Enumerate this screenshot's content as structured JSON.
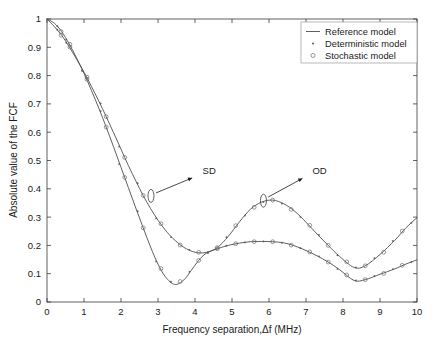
{
  "figure": {
    "title": "",
    "background_color": "#ffffff"
  },
  "axes": {
    "x_label": "Frequency separation,Δf (MHz)",
    "y_label": "Absolute value of the FCF",
    "x_ticks": [
      "0",
      "1",
      "2",
      "3",
      "4",
      "5",
      "6",
      "7",
      "8",
      "9",
      "10"
    ],
    "y_ticks": [
      "0",
      "0.1",
      "0.2",
      "0.3",
      "0.4",
      "0.5",
      "0.6",
      "0.7",
      "0.8",
      "0.9",
      "1"
    ]
  },
  "legend": {
    "position": "top-right",
    "entries": [
      {
        "label": "Reference model",
        "marker": "line"
      },
      {
        "label": "Deterministic model",
        "marker": "dot"
      },
      {
        "label": "Stochastic model",
        "marker": "circle"
      }
    ]
  },
  "annotations": [
    {
      "name": "sd-annotation",
      "label": "SD",
      "label_x": 4.15,
      "label_y": 0.445,
      "target_x": 2.81,
      "target_y": 0.375
    },
    {
      "name": "od-annotation",
      "label": "OD",
      "label_x": 7.12,
      "label_y": 0.445,
      "target_x": 5.85,
      "target_y": 0.358
    }
  ],
  "chart_data": {
    "type": "line",
    "title": "",
    "xlabel": "Frequency separation,Δf (MHz)",
    "ylabel": "Absolute value of the FCF",
    "xlim": [
      0,
      10
    ],
    "ylim": [
      0,
      1
    ],
    "xticks": [
      0,
      1,
      2,
      3,
      4,
      5,
      6,
      7,
      8,
      9,
      10
    ],
    "yticks": [
      0,
      0.1,
      0.2,
      0.3,
      0.4,
      0.5,
      0.6,
      0.7,
      0.8,
      0.9,
      1.0
    ],
    "grid": false,
    "legend_position": "upper right",
    "series": [
      {
        "name": "Reference model (SD)",
        "style": "line",
        "x": [
          0.0,
          0.2,
          0.4,
          0.6,
          0.8,
          1.0,
          1.2,
          1.4,
          1.6,
          1.8,
          2.0,
          2.2,
          2.4,
          2.6,
          2.8,
          3.0,
          3.2,
          3.45,
          3.7,
          3.9,
          4.1,
          4.3,
          4.6,
          4.9,
          5.2,
          5.5,
          5.8,
          6.1,
          6.4,
          6.7,
          7.0,
          7.3,
          7.6,
          7.9,
          8.3,
          8.6,
          9.0,
          9.4,
          9.7,
          10.0
        ],
        "y": [
          1.0,
          0.985,
          0.955,
          0.912,
          0.862,
          0.808,
          0.748,
          0.685,
          0.618,
          0.548,
          0.476,
          0.404,
          0.332,
          0.262,
          0.194,
          0.134,
          0.089,
          0.062,
          0.078,
          0.112,
          0.147,
          0.172,
          0.188,
          0.2,
          0.208,
          0.213,
          0.214,
          0.213,
          0.209,
          0.198,
          0.182,
          0.163,
          0.141,
          0.115,
          0.076,
          0.079,
          0.098,
          0.117,
          0.134,
          0.149
        ]
      },
      {
        "name": "Reference model (OD)",
        "style": "line",
        "x": [
          0.0,
          0.2,
          0.4,
          0.6,
          0.8,
          1.0,
          1.2,
          1.4,
          1.6,
          1.8,
          2.0,
          2.2,
          2.4,
          2.6,
          2.8,
          3.0,
          3.2,
          3.4,
          3.7,
          4.0,
          4.3,
          4.6,
          4.9,
          5.2,
          5.5,
          5.8,
          6.1,
          6.4,
          6.7,
          7.0,
          7.3,
          7.6,
          7.9,
          8.3,
          8.6,
          9.0,
          9.4,
          9.7,
          10.0
        ],
        "y": [
          1.0,
          0.973,
          0.942,
          0.902,
          0.858,
          0.812,
          0.762,
          0.71,
          0.655,
          0.598,
          0.54,
          0.482,
          0.428,
          0.376,
          0.33,
          0.289,
          0.254,
          0.225,
          0.193,
          0.176,
          0.175,
          0.192,
          0.232,
          0.283,
          0.328,
          0.353,
          0.36,
          0.347,
          0.32,
          0.282,
          0.24,
          0.2,
          0.162,
          0.122,
          0.128,
          0.168,
          0.218,
          0.262,
          0.298
        ]
      }
    ],
    "markers": {
      "deterministic_x": [
        0.28,
        0.52,
        0.95,
        1.45,
        1.95,
        2.45,
        2.95,
        3.35,
        3.85,
        4.35,
        4.85,
        5.35,
        5.85,
        6.35,
        6.85,
        7.35,
        7.85,
        8.35,
        8.85,
        9.35,
        9.85
      ],
      "stochastic_x": [
        0.38,
        0.62,
        1.08,
        1.6,
        2.1,
        2.6,
        3.08,
        3.6,
        4.1,
        4.6,
        5.1,
        5.6,
        6.1,
        6.6,
        7.1,
        7.6,
        8.1,
        8.6,
        9.1,
        9.6
      ]
    },
    "annotations": [
      {
        "text": "SD",
        "points_to": [
          2.81,
          0.375
        ]
      },
      {
        "text": "OD",
        "points_to": [
          5.85,
          0.358
        ]
      }
    ],
    "key_features": {
      "sd_curve_minimum": {
        "x": 3.45,
        "y": 0.062
      },
      "sd_curve_plateau": {
        "x": 5.8,
        "y": 0.214
      },
      "sd_curve_second_min": {
        "x": 8.3,
        "y": 0.076
      },
      "sd_curve_end": {
        "x": 10,
        "y": 0.149
      },
      "od_curve_min": {
        "x": 4.15,
        "y": 0.174
      },
      "od_curve_peak": {
        "x": 6.0,
        "y": 0.36
      },
      "od_curve_second_min": {
        "x": 8.3,
        "y": 0.122
      },
      "od_curve_end": {
        "x": 10,
        "y": 0.298
      },
      "curves_cross_at": {
        "x": 4.28,
        "y": 0.178
      }
    }
  }
}
